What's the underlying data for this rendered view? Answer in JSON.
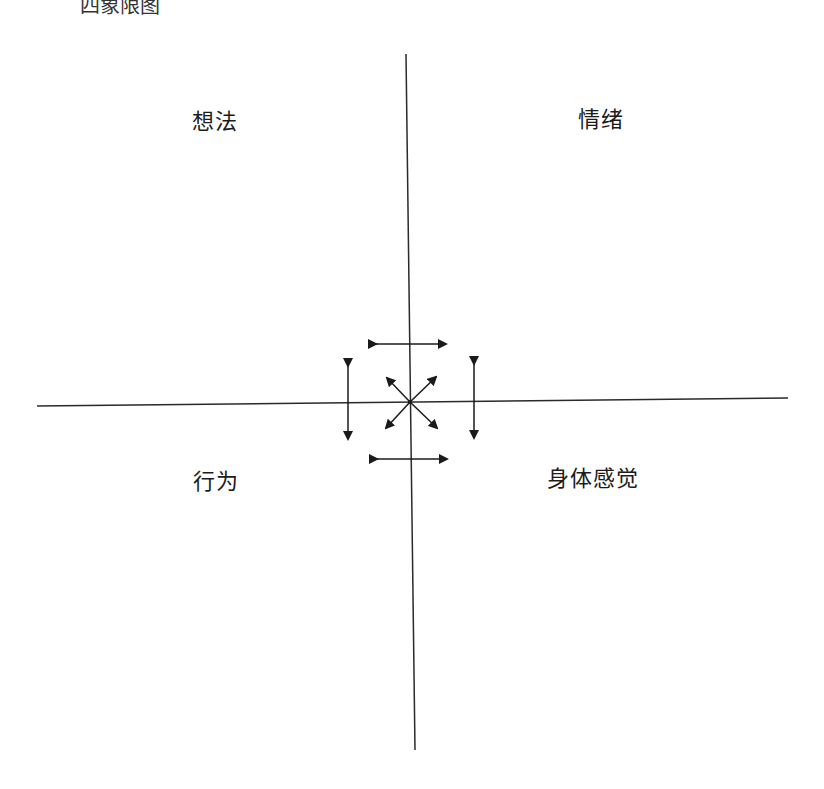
{
  "title_partial": "四象限图",
  "quadrants": {
    "top_left": "想法",
    "top_right": "情绪",
    "bottom_left": "行为",
    "bottom_right": "身体感觉"
  },
  "colors": {
    "line": "#2a2a2a",
    "text": "#1c1c1c"
  },
  "axes": {
    "vertical": {
      "x1": 406,
      "y1": 54,
      "x2": 415,
      "y2": 750
    },
    "horizontal": {
      "x1": 37,
      "y1": 406,
      "x2": 788,
      "y2": 398
    }
  }
}
